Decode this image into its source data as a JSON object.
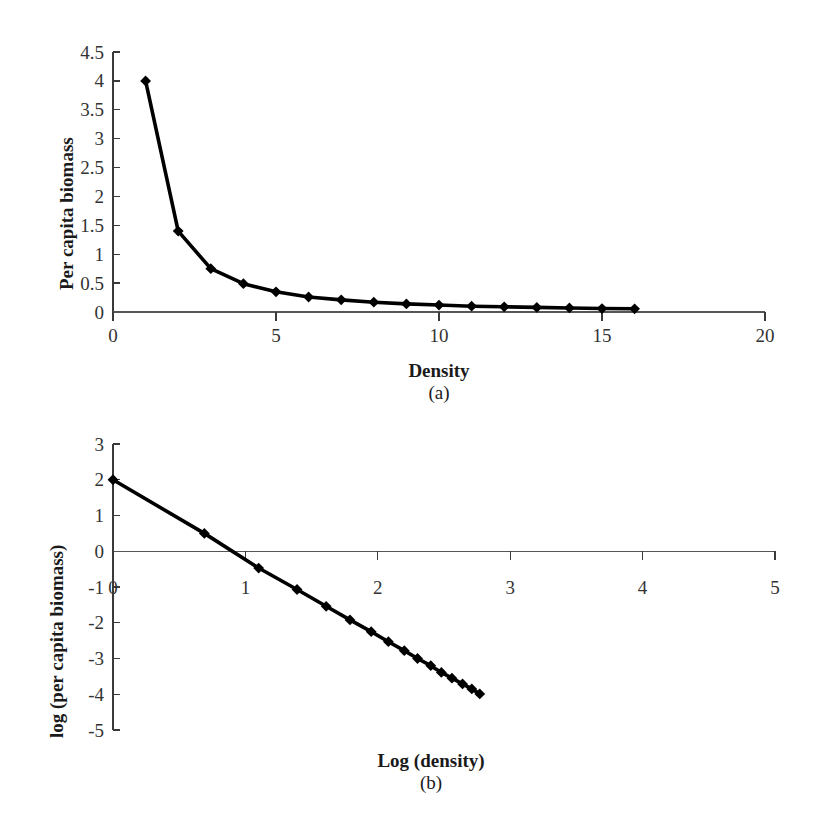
{
  "figure": {
    "panels": [
      {
        "id": "a",
        "caption": "(a)",
        "xlabel": "Density",
        "ylabel": "Per capita biomass"
      },
      {
        "id": "b",
        "caption": "(b)",
        "xlabel": "Log (density)",
        "ylabel": "log (per capita biomass)"
      }
    ],
    "colors": {
      "line": "#000000",
      "axis": "#3a3a3a",
      "text": "#1a1a1a",
      "background": "#ffffff"
    }
  },
  "chart_data": [
    {
      "type": "line",
      "panel": "a",
      "title": "",
      "xlabel": "Density",
      "ylabel": "Per capita biomass",
      "caption": "(a)",
      "xlim": [
        0,
        20
      ],
      "ylim": [
        0,
        4.5
      ],
      "xticks": [
        0,
        5,
        10,
        15,
        20
      ],
      "xticklabels": [
        "0",
        "5",
        "10",
        "15",
        "20"
      ],
      "yticks": [
        0,
        0.5,
        1,
        1.5,
        2,
        2.5,
        3,
        3.5,
        4,
        4.5
      ],
      "yticklabels": [
        "0",
        "0.5",
        "1",
        "1.5",
        "2",
        "2.5",
        "3",
        "3.5",
        "4",
        "4.5"
      ],
      "grid": false,
      "legend": false,
      "marker": "diamond",
      "x": [
        1,
        2,
        3,
        4,
        5,
        6,
        7,
        8,
        9,
        10,
        11,
        12,
        13,
        14,
        15,
        16
      ],
      "values": [
        4.0,
        1.4,
        0.75,
        0.49,
        0.35,
        0.26,
        0.21,
        0.17,
        0.14,
        0.12,
        0.1,
        0.09,
        0.08,
        0.07,
        0.06,
        0.055
      ]
    },
    {
      "type": "line",
      "panel": "b",
      "title": "",
      "xlabel": "Log (density)",
      "ylabel": "log (per capita biomass)",
      "caption": "(b)",
      "xlim": [
        0,
        5
      ],
      "ylim": [
        -5,
        3
      ],
      "xticks": [
        0,
        1,
        2,
        3,
        4,
        5
      ],
      "xticklabels": [
        "0",
        "1",
        "2",
        "3",
        "4",
        "5"
      ],
      "yticks": [
        -5,
        -4,
        -3,
        -2,
        -1,
        0,
        1,
        2,
        3
      ],
      "yticklabels": [
        "-5",
        "-4",
        "-3",
        "-2",
        "-1",
        "0",
        "1",
        "2",
        "3"
      ],
      "grid": false,
      "legend": false,
      "marker": "diamond",
      "x": [
        0,
        0.69,
        1.1,
        1.39,
        1.61,
        1.79,
        1.95,
        2.08,
        2.2,
        2.3,
        2.4,
        2.48,
        2.56,
        2.64,
        2.71,
        2.77
      ],
      "values": [
        2.0,
        0.5,
        -0.47,
        -1.07,
        -1.54,
        -1.92,
        -2.25,
        -2.53,
        -2.78,
        -3.0,
        -3.2,
        -3.39,
        -3.55,
        -3.71,
        -3.85,
        -3.99
      ]
    }
  ]
}
